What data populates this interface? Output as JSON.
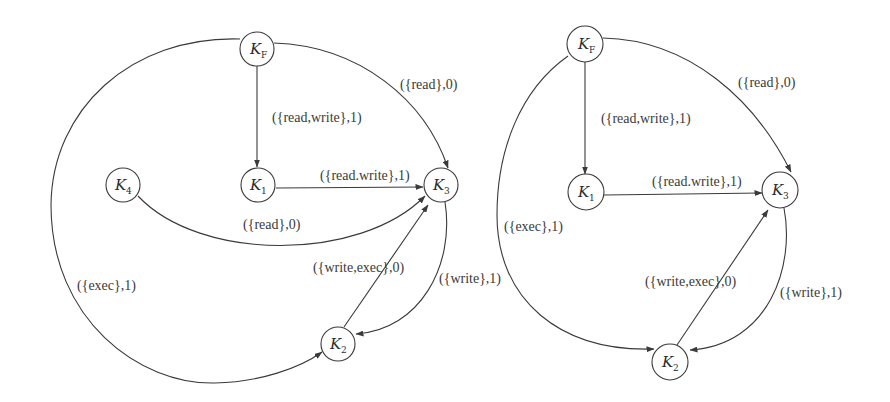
{
  "diagrams": [
    {
      "id": "left",
      "nodes": [
        {
          "id": "KF",
          "base": "K",
          "sub": "F"
        },
        {
          "id": "K1",
          "base": "K",
          "sub": "1"
        },
        {
          "id": "K2",
          "base": "K",
          "sub": "2"
        },
        {
          "id": "K3",
          "base": "K",
          "sub": "3"
        },
        {
          "id": "K4",
          "base": "K",
          "sub": "4"
        }
      ],
      "edges": [
        {
          "from": "KF",
          "to": "K1",
          "label": "({read,write},1)"
        },
        {
          "from": "KF",
          "to": "K3",
          "label": "({read},0)"
        },
        {
          "from": "K1",
          "to": "K3",
          "label": "({read.write},1)"
        },
        {
          "from": "K4",
          "to": "K3",
          "label": "({read},0)"
        },
        {
          "from": "K2",
          "to": "K3",
          "label": "({write,exec},0)"
        },
        {
          "from": "K3",
          "to": "K2",
          "label": "({write},1)"
        },
        {
          "from": "KF",
          "to": "K2",
          "label": "({exec},1)"
        }
      ]
    },
    {
      "id": "right",
      "nodes": [
        {
          "id": "KF",
          "base": "K",
          "sub": "F"
        },
        {
          "id": "K1",
          "base": "K",
          "sub": "1"
        },
        {
          "id": "K2",
          "base": "K",
          "sub": "2"
        },
        {
          "id": "K3",
          "base": "K",
          "sub": "3"
        }
      ],
      "edges": [
        {
          "from": "KF",
          "to": "K1",
          "label": "({read,write},1)"
        },
        {
          "from": "KF",
          "to": "K3",
          "label": "({read},0)"
        },
        {
          "from": "K1",
          "to": "K3",
          "label": "({read.write},1)"
        },
        {
          "from": "K2",
          "to": "K3",
          "label": "({write,exec},0)"
        },
        {
          "from": "K3",
          "to": "K2",
          "label": "({write},1)"
        },
        {
          "from": "KF",
          "to": "K2",
          "label": "({exec},1)"
        }
      ]
    }
  ]
}
